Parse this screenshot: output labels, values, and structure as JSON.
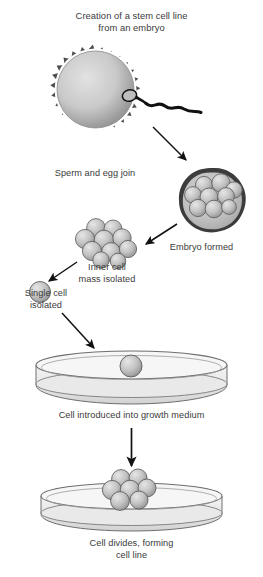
{
  "figure": {
    "title": "Creation of a stem cell line\nfrom an embryo",
    "background_color": "#ffffff",
    "text_color": "#3b3b3b",
    "type": "process-flow-diagram"
  },
  "labels": {
    "sperm_and_egg": "Sperm and egg join",
    "embryo_formed": "Embryo formed",
    "inner_cell_mass": "Inner cell\nmass isolated",
    "single_cell": "Single cell\nisolated",
    "growth_medium": "Cell introduced into growth medium",
    "cell_divides": "Cell divides, forming\ncell line"
  },
  "colors": {
    "corona": "#4d4d4d",
    "egg_body_light": "#d8d8d8",
    "egg_body_dark": "#8f8f8f",
    "cell_fill_light": "#d4d4d4",
    "cell_fill_dark": "#9a9a9a",
    "cell_outline": "#555555",
    "embryo_ring": "#3c3c3c",
    "embryo_interior": "#c2c2c2",
    "dish_outline": "#6e6e6e",
    "dish_fill": "#ededed",
    "arrow": "#111111",
    "sperm": "#111111"
  },
  "stages": [
    {
      "order": 1,
      "name": "sperm-and-egg-join",
      "caption": "Sperm and egg join"
    },
    {
      "order": 2,
      "name": "embryo-formed",
      "caption": "Embryo formed"
    },
    {
      "order": 3,
      "name": "inner-cell-mass-isolated",
      "caption": "Inner cell mass isolated"
    },
    {
      "order": 4,
      "name": "single-cell-isolated",
      "caption": "Single cell isolated"
    },
    {
      "order": 5,
      "name": "cell-introduced-into-growth-medium",
      "caption": "Cell introduced into growth medium"
    },
    {
      "order": 6,
      "name": "cell-divides-forming-cell-line",
      "caption": "Cell divides, forming cell line"
    }
  ],
  "counts": {
    "embryo_cells": 9,
    "inner_cell_mass_cells": 10,
    "single_cell": 1,
    "dish_colony_cells": 7
  }
}
